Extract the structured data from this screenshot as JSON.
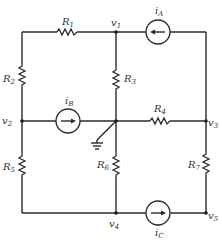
{
  "diagram": {
    "type": "electrical-circuit",
    "resistors": [
      {
        "id": "R1",
        "label": "R",
        "sub": "1"
      },
      {
        "id": "R2",
        "label": "R",
        "sub": "2"
      },
      {
        "id": "R3",
        "label": "R",
        "sub": "3"
      },
      {
        "id": "R4",
        "label": "R",
        "sub": "4"
      },
      {
        "id": "R5",
        "label": "R",
        "sub": "5"
      },
      {
        "id": "R6",
        "label": "R",
        "sub": "6"
      },
      {
        "id": "R7",
        "label": "R",
        "sub": "7"
      }
    ],
    "current_sources": [
      {
        "id": "iA",
        "label": "i",
        "sub": "A",
        "direction": "left"
      },
      {
        "id": "iB",
        "label": "i",
        "sub": "B",
        "direction": "right"
      },
      {
        "id": "iC",
        "label": "i",
        "sub": "C",
        "direction": "right"
      }
    ],
    "nodes": [
      {
        "id": "v1",
        "label": "v",
        "sub": "1"
      },
      {
        "id": "v2",
        "label": "v",
        "sub": "2"
      },
      {
        "id": "v3",
        "label": "v",
        "sub": "3"
      },
      {
        "id": "v4",
        "label": "v",
        "sub": "4"
      },
      {
        "id": "v5",
        "label": "v",
        "sub": "5"
      }
    ],
    "ground": "ground-symbol"
  }
}
